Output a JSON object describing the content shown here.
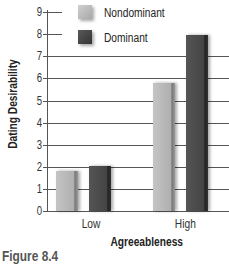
{
  "chart_data": {
    "type": "bar",
    "title": "",
    "caption": "Figure 8.4",
    "xlabel": "Agreeableness",
    "ylabel": "Dating Desirability",
    "categories": [
      "Low",
      "High"
    ],
    "series": [
      {
        "name": "Nondominant",
        "values": [
          1.8,
          5.8
        ],
        "color": "#b8b8b8"
      },
      {
        "name": "Dominant",
        "values": [
          2.05,
          7.95
        ],
        "color": "#474747"
      }
    ],
    "ylim": [
      0,
      9
    ],
    "yticks": [
      "0",
      "1",
      "2",
      "3",
      "4",
      "5",
      "6",
      "7",
      "8",
      "9"
    ],
    "grid": true,
    "legend_position": "upper-left"
  },
  "legend": {
    "items": [
      {
        "label": "Nondominant"
      },
      {
        "label": "Dominant"
      }
    ]
  }
}
